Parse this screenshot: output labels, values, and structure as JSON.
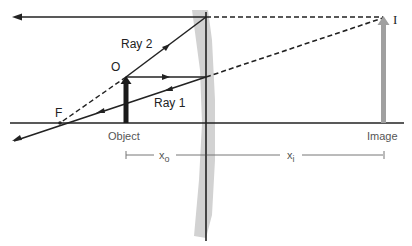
{
  "diagram": {
    "type": "ray-diagram",
    "labels": {
      "ray1": "Ray 1",
      "ray2": "Ray 2",
      "object_point": "O",
      "focal_point": "F",
      "image_point": "I",
      "object": "Object",
      "image": "Image",
      "object_distance": "x",
      "object_distance_sub": "o",
      "image_distance": "x",
      "image_distance_sub": "i"
    },
    "colors": {
      "line": "#222222",
      "lens_fill": "#cfcfcf",
      "image_arrow": "#a0a0a0",
      "object_arrow": "#1a1a1a",
      "background": "#ffffff"
    }
  }
}
